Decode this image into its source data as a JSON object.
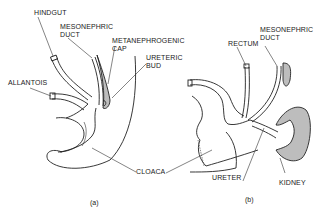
{
  "panel_a": {
    "caption": "(a)",
    "labels": {
      "hindgut": "HINDGUT",
      "mesonephric_duct": "MESONEPHRIC\nDUCT",
      "metanephrogenic_cap": "METANEPHROGENIC\nCAP",
      "ureteric_bud": "URETERIC\nBUD",
      "allantois": "ALLANTOIS"
    }
  },
  "panel_b": {
    "caption": "(b)",
    "labels": {
      "rectum": "RECTUM",
      "mesonephric_duct": "MESONEPHRIC\nDUCT",
      "ureter": "URETER",
      "kidney": "KIDNEY"
    }
  },
  "shared": {
    "cloaca": "CLOACA"
  },
  "colors": {
    "ink": "#222222",
    "shading": "#bdbdbd",
    "background": "#ffffff"
  }
}
